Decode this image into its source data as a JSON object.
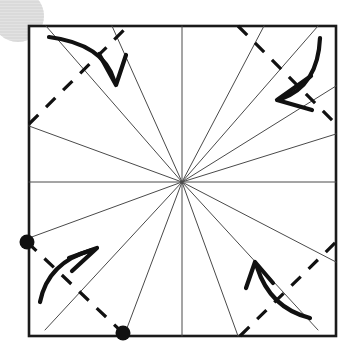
{
  "canvas": {
    "width": 350,
    "height": 355,
    "background": "#ffffff",
    "title": "Origami square fold diagram"
  },
  "watermark": {
    "name": "corner-watermark-circle",
    "cx": 18,
    "cy": 16,
    "r": 26,
    "color": "#e2e2e2",
    "stripe_color": "#d2d2d2"
  },
  "square": {
    "label": "paper-outline",
    "x": 29,
    "y": 26,
    "width": 307,
    "height": 310,
    "stroke": "#1a1a1a",
    "stroke_width": 2.6,
    "fill": "#ffffff"
  },
  "center": {
    "label": "center-point",
    "x": 182,
    "y": 182
  },
  "crease_lines": {
    "label": "radiating-crease-lines",
    "stroke": "#4a4a4a",
    "stroke_width": 1.0,
    "count": 16,
    "endpoints": [
      {
        "name": "crease-e",
        "x": 336,
        "y": 182
      },
      {
        "name": "crease-ene",
        "x": 336,
        "y": 134
      },
      {
        "name": "crease-ne-d",
        "x": 336,
        "y": 86
      },
      {
        "name": "crease-ne",
        "x": 318,
        "y": 26
      },
      {
        "name": "crease-nne",
        "x": 264,
        "y": 26
      },
      {
        "name": "crease-n",
        "x": 182,
        "y": 26
      },
      {
        "name": "crease-nnw",
        "x": 112,
        "y": 26
      },
      {
        "name": "crease-nw",
        "x": 46,
        "y": 26
      },
      {
        "name": "crease-wnw",
        "x": 29,
        "y": 126
      },
      {
        "name": "crease-w",
        "x": 29,
        "y": 182
      },
      {
        "name": "crease-wsw",
        "x": 29,
        "y": 238
      },
      {
        "name": "crease-sw",
        "x": 45,
        "y": 330
      },
      {
        "name": "crease-ssw",
        "x": 124,
        "y": 336
      },
      {
        "name": "crease-s",
        "x": 182,
        "y": 336
      },
      {
        "name": "crease-sse",
        "x": 238,
        "y": 336
      },
      {
        "name": "crease-se",
        "x": 318,
        "y": 330
      },
      {
        "name": "crease-ese",
        "x": 336,
        "y": 262
      }
    ]
  },
  "fold_lines": {
    "label": "dashed-corner-fold-lines",
    "stroke": "#111111",
    "stroke_width": 3.2,
    "dash_pattern": "13 11",
    "items": [
      {
        "name": "fold-line-top-left",
        "x1": 29,
        "y1": 124,
        "x2": 128,
        "y2": 26
      },
      {
        "name": "fold-line-top-right",
        "x1": 238,
        "y1": 26,
        "x2": 336,
        "y2": 124
      },
      {
        "name": "fold-line-bottom-left",
        "x1": 27,
        "y1": 242,
        "x2": 123,
        "y2": 333
      },
      {
        "name": "fold-line-bottom-right",
        "x1": 240,
        "y1": 336,
        "x2": 336,
        "y2": 242
      }
    ]
  },
  "markers": {
    "label": "reference-dots",
    "fill": "#111111",
    "radius": 7.5,
    "items": [
      {
        "name": "dot-left-edge",
        "cx": 27,
        "cy": 242
      },
      {
        "name": "dot-bottom-edge",
        "cx": 123,
        "cy": 333
      }
    ]
  },
  "arrows": {
    "label": "fold-direction-arrows",
    "stroke": "#111111",
    "stroke_width": 4.2,
    "items": [
      {
        "name": "arrow-top-left-fold",
        "direction": "down-right",
        "path": "M 49,37 Q 103,44 114,80",
        "head": "M 99,54 L 116,85 L 126,55"
      },
      {
        "name": "arrow-top-right-fold",
        "direction": "down-left",
        "path": "M 320,38 Q 318,86 281,99",
        "head": "M 311,76 L 277,100 L 312,110"
      },
      {
        "name": "arrow-bottom-left-fold",
        "direction": "up-right",
        "path": "M 40,302 Q 48,262 92,250",
        "head": "M 69,258 L 97,248 L 72,271"
      },
      {
        "name": "arrow-bottom-right-fold",
        "direction": "up-left",
        "path": "M 310,318 Q 270,308 257,267",
        "head": "M 246,288 L 255,262 L 273,283"
      }
    ]
  }
}
